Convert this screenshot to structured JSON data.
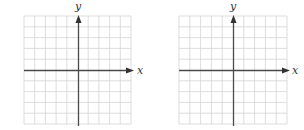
{
  "colors": {
    "grid": "#d4d4d4",
    "axis": "#4a4a4a",
    "background": "#ffffff"
  },
  "grids": [
    {
      "x_label": "x",
      "y_label": "y",
      "columns": 10,
      "rows": 10,
      "y_axis_column": 5,
      "x_axis_row": 5
    },
    {
      "x_label": "x",
      "y_label": "y",
      "columns": 10,
      "rows": 10,
      "y_axis_column": 5,
      "x_axis_row": 5
    }
  ]
}
